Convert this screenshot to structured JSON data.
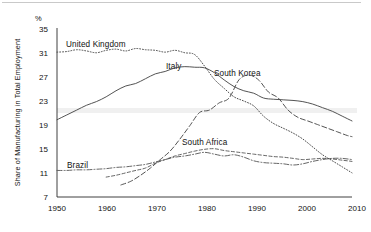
{
  "figure": {
    "unit_label": "%",
    "y_axis_title": "Share of Manufacturing in Total Employment",
    "y_ticks": [
      "35",
      "31",
      "27",
      "23",
      "19",
      "15",
      "11",
      "7"
    ],
    "x_ticks": [
      "1950",
      "1960",
      "1970",
      "1980",
      "1990",
      "2000",
      "2010"
    ],
    "series_labels": {
      "uk": "United Kingdom",
      "italy": "Italy",
      "south_korea": "South Korea",
      "south_africa": "South Africa",
      "brazil": "Brazil"
    }
  },
  "chart_data": {
    "type": "line",
    "title": "",
    "xlabel": "",
    "ylabel": "Share of Manufacturing in Total Employment",
    "unit": "%",
    "xlim": [
      1950,
      2010
    ],
    "ylim": [
      7,
      35
    ],
    "ytick_values": [
      35,
      31,
      27,
      23,
      19,
      15,
      11,
      7
    ],
    "xtick_values": [
      1950,
      1960,
      1970,
      1980,
      1990,
      2000,
      2010
    ],
    "grid": false,
    "legend": "inline-labels",
    "series": [
      {
        "name": "United Kingdom",
        "style": "dotted",
        "label_position": {
          "x": 1955,
          "y": 33.2
        },
        "x": [
          1950,
          1952,
          1954,
          1956,
          1958,
          1960,
          1962,
          1964,
          1966,
          1968,
          1970,
          1972,
          1974,
          1976,
          1978,
          1980,
          1982,
          1984,
          1986,
          1988,
          1990,
          1992,
          1994,
          1996,
          1998,
          2000,
          2002,
          2004,
          2006,
          2008,
          2010
        ],
        "values": [
          31.0,
          31.1,
          31.4,
          31.2,
          30.9,
          31.3,
          31.5,
          31.2,
          31.6,
          31.4,
          31.3,
          31.0,
          31.3,
          30.9,
          30.6,
          28.7,
          26.5,
          25.0,
          23.6,
          22.9,
          22.1,
          20.4,
          19.2,
          18.4,
          17.6,
          16.6,
          15.3,
          14.0,
          13.0,
          12.0,
          11.0
        ]
      },
      {
        "name": "Italy",
        "style": "solid",
        "label_position": {
          "x": 1976,
          "y": 29.5
        },
        "x": [
          1950,
          1952,
          1954,
          1956,
          1958,
          1960,
          1962,
          1964,
          1966,
          1968,
          1970,
          1972,
          1974,
          1976,
          1978,
          1980,
          1982,
          1984,
          1986,
          1988,
          1990,
          1992,
          1994,
          1996,
          1998,
          2000,
          2002,
          2004,
          2006,
          2008,
          2010
        ],
        "values": [
          19.8,
          20.6,
          21.4,
          22.2,
          22.8,
          23.6,
          24.6,
          25.4,
          25.8,
          26.6,
          27.4,
          27.8,
          28.4,
          28.6,
          28.5,
          28.4,
          27.6,
          26.4,
          25.3,
          24.6,
          24.2,
          23.4,
          23.2,
          23.1,
          23.0,
          22.8,
          22.4,
          21.8,
          21.2,
          20.4,
          19.6
        ]
      },
      {
        "name": "South Korea",
        "style": "dashed",
        "label_position": {
          "x": 1988,
          "y": 28.0
        },
        "x": [
          1963,
          1965,
          1967,
          1969,
          1971,
          1973,
          1975,
          1977,
          1979,
          1981,
          1983,
          1985,
          1987,
          1989,
          1991,
          1993,
          1995,
          1997,
          1999,
          2001,
          2003,
          2005,
          2007,
          2009,
          2010
        ],
        "values": [
          9.0,
          9.6,
          10.6,
          11.8,
          13.2,
          14.6,
          16.6,
          18.8,
          21.0,
          21.4,
          22.6,
          23.4,
          26.4,
          27.2,
          26.4,
          24.4,
          23.4,
          21.4,
          20.2,
          19.6,
          19.0,
          18.4,
          17.8,
          17.2,
          17.0
        ]
      },
      {
        "name": "South Africa",
        "style": "dashed-fine",
        "label_position": {
          "x": 1980,
          "y": 15.6
        },
        "x": [
          1960,
          1962,
          1964,
          1966,
          1968,
          1970,
          1972,
          1974,
          1976,
          1978,
          1980,
          1982,
          1984,
          1986,
          1988,
          1990,
          1992,
          1994,
          1996,
          1998,
          2000,
          2002,
          2004,
          2006,
          2008,
          2010
        ],
        "values": [
          10.3,
          10.6,
          11.0,
          11.4,
          11.8,
          12.6,
          13.2,
          13.8,
          14.2,
          14.6,
          14.9,
          15.0,
          14.7,
          14.5,
          14.3,
          14.1,
          13.9,
          13.7,
          13.6,
          13.4,
          13.2,
          13.3,
          13.4,
          13.3,
          13.1,
          12.9
        ]
      },
      {
        "name": "Brazil",
        "style": "dash-dot",
        "label_position": {
          "x": 1959,
          "y": 12.3
        },
        "x": [
          1950,
          1952,
          1954,
          1956,
          1958,
          1960,
          1962,
          1964,
          1966,
          1968,
          1970,
          1972,
          1974,
          1976,
          1978,
          1980,
          1982,
          1984,
          1986,
          1988,
          1990,
          1992,
          1994,
          1996,
          1998,
          2000,
          2002,
          2004,
          2006,
          2008,
          2010
        ],
        "values": [
          11.4,
          11.4,
          11.5,
          11.5,
          11.6,
          11.7,
          11.9,
          12.0,
          12.2,
          12.4,
          12.8,
          13.2,
          13.6,
          13.8,
          14.1,
          14.4,
          14.1,
          13.8,
          14.0,
          13.6,
          13.0,
          12.7,
          12.6,
          12.5,
          12.3,
          12.5,
          12.9,
          13.2,
          13.4,
          13.4,
          13.2
        ]
      }
    ]
  }
}
